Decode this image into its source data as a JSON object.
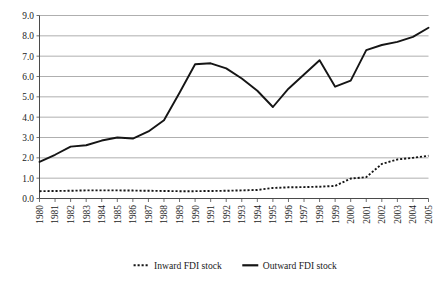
{
  "chart_data": {
    "type": "line",
    "title": "",
    "subtitle": "",
    "xlabel": "",
    "ylabel": "",
    "grid": "horizontal",
    "legend_position": "bottom",
    "ylim": [
      0.0,
      9.0
    ],
    "ytick_step": 1.0,
    "ytick_labels": [
      "0.0",
      "1.0",
      "2.0",
      "3.0",
      "4.0",
      "5.0",
      "6.0",
      "7.0",
      "8.0",
      "9.0"
    ],
    "ytick_values": [
      0.0,
      1.0,
      2.0,
      3.0,
      4.0,
      5.0,
      6.0,
      7.0,
      8.0,
      9.0
    ],
    "categories": [
      "1980",
      "1981",
      "1982",
      "1983",
      "1984",
      "1985",
      "1986",
      "1987",
      "1988",
      "1989",
      "1990",
      "1991",
      "1992",
      "1993",
      "1994",
      "1995",
      "1996",
      "1997",
      "1998",
      "1999",
      "2000",
      "2001",
      "2002",
      "2003",
      "2004",
      "2005"
    ],
    "series": [
      {
        "name": "Inward FDI stock",
        "style": "dotted",
        "color": "#151515",
        "values": [
          0.36,
          0.37,
          0.38,
          0.4,
          0.4,
          0.4,
          0.39,
          0.38,
          0.37,
          0.36,
          0.36,
          0.37,
          0.38,
          0.4,
          0.42,
          0.52,
          0.55,
          0.56,
          0.58,
          0.62,
          0.98,
          1.05,
          1.7,
          1.92,
          2.0,
          2.1
        ]
      },
      {
        "name": "Outward FDI stock",
        "style": "solid",
        "color": "#151515",
        "values": [
          1.8,
          2.15,
          2.55,
          2.62,
          2.85,
          3.0,
          2.95,
          3.3,
          3.85,
          5.2,
          6.6,
          6.65,
          6.4,
          5.9,
          5.3,
          4.5,
          5.4,
          6.1,
          6.8,
          5.5,
          5.8,
          7.3,
          7.55,
          7.7,
          7.95,
          8.4
        ]
      }
    ]
  },
  "legend": {
    "items": [
      {
        "label": "Inward FDI stock",
        "style": "dotted"
      },
      {
        "label": "Outward FDI stock",
        "style": "solid"
      }
    ]
  }
}
